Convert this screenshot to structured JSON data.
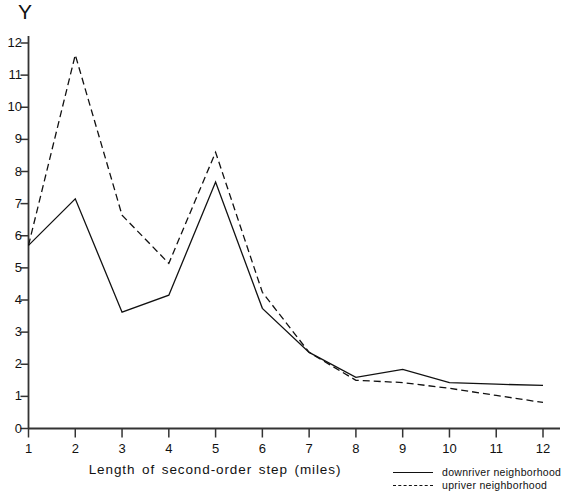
{
  "chart_data": {
    "type": "line",
    "title": "",
    "xlabel": "Length of second-order step (miles)",
    "ylabel": "Y",
    "x": [
      1,
      2,
      3,
      4,
      5,
      6,
      7,
      8,
      9,
      10,
      11,
      12
    ],
    "xlim": [
      1,
      12
    ],
    "ylim": [
      0,
      12
    ],
    "grid": false,
    "legend_position": "bottom-right",
    "xticks": [
      "1",
      "2",
      "3",
      "4",
      "5",
      "6",
      "7",
      "8",
      "9",
      "10",
      "11",
      "12"
    ],
    "yticks": [
      "0",
      "1",
      "2",
      "3",
      "4",
      "5",
      "6",
      "7",
      "8",
      "9",
      "10",
      "11",
      "12"
    ],
    "series": [
      {
        "name": "downriver neighborhood",
        "style": "solid",
        "color": "#111111",
        "values": [
          5.7,
          7.15,
          3.62,
          4.15,
          7.67,
          3.74,
          2.37,
          1.59,
          1.84,
          1.43,
          1.38,
          1.34
        ]
      },
      {
        "name": "upriver neighborhood",
        "style": "dashed",
        "color": "#111111",
        "values": [
          5.7,
          11.63,
          6.64,
          5.14,
          8.6,
          4.24,
          2.37,
          1.5,
          1.43,
          1.25,
          1.03,
          0.81
        ]
      }
    ]
  },
  "axes": {
    "y_axis_title": "Y",
    "x_axis_title": "Length of second-order step (miles)"
  },
  "legend": {
    "items": [
      {
        "label": "downriver neighborhood",
        "style": "solid"
      },
      {
        "label": "upriver neighborhood",
        "style": "dashed"
      }
    ]
  }
}
